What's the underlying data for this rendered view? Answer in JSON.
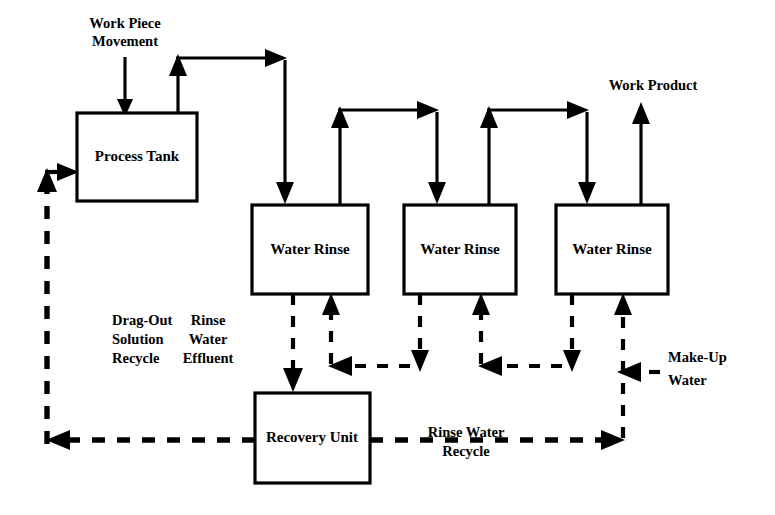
{
  "diagram": {
    "background_color": "#ffffff",
    "line_color": "#000000",
    "boxes": [
      {
        "id": "process-tank",
        "label": "Process Tank",
        "x": 77,
        "y": 113,
        "w": 120,
        "h": 88
      },
      {
        "id": "water-rinse-1",
        "label": "Water Rinse",
        "x": 252,
        "y": 205,
        "w": 116,
        "h": 89
      },
      {
        "id": "water-rinse-2",
        "label": "Water Rinse",
        "x": 404,
        "y": 205,
        "w": 112,
        "h": 89
      },
      {
        "id": "water-rinse-3",
        "label": "Water Rinse",
        "x": 556,
        "y": 205,
        "w": 112,
        "h": 89
      },
      {
        "id": "recovery-unit",
        "label": "Recovery Unit",
        "x": 255,
        "y": 393,
        "w": 115,
        "h": 90
      }
    ],
    "labels": [
      {
        "id": "work-piece-movement",
        "lines": [
          "Work Piece",
          "Movement"
        ],
        "x": 125,
        "y": 28,
        "align": "center"
      },
      {
        "id": "work-product",
        "lines": [
          "Work Product"
        ],
        "x": 653,
        "y": 90,
        "align": "center"
      },
      {
        "id": "drag-out-solution-recycle",
        "lines": [
          "Drag-Out",
          "Solution",
          "Recycle"
        ],
        "x": 112,
        "y": 325,
        "align": "start"
      },
      {
        "id": "rinse-water-effluent",
        "lines": [
          "Rinse",
          "Water",
          "Effluent"
        ],
        "x": 208,
        "y": 325,
        "align": "center"
      },
      {
        "id": "rinse-water-recycle",
        "lines": [
          "Rinse Water",
          "Recycle"
        ],
        "x": 466,
        "y": 428,
        "align": "center"
      },
      {
        "id": "make-up-water",
        "lines": [
          "Make-Up",
          "Water"
        ],
        "x": 668,
        "y": 355,
        "align": "start"
      }
    ],
    "flows": {
      "work_piece_path": "Process Tank to Water Rinse 1 to Water Rinse 2 to Water Rinse 3 to Work Product",
      "water_path": "Make-Up Water to Water Rinse 3 to Water Rinse 2 to Water Rinse 1 to Recovery Unit",
      "recycle_path": "Recovery Unit to Process Tank (Drag-Out Solution Recycle) and Recovery Unit to Water Rinse 3 (Rinse Water Recycle)"
    }
  }
}
